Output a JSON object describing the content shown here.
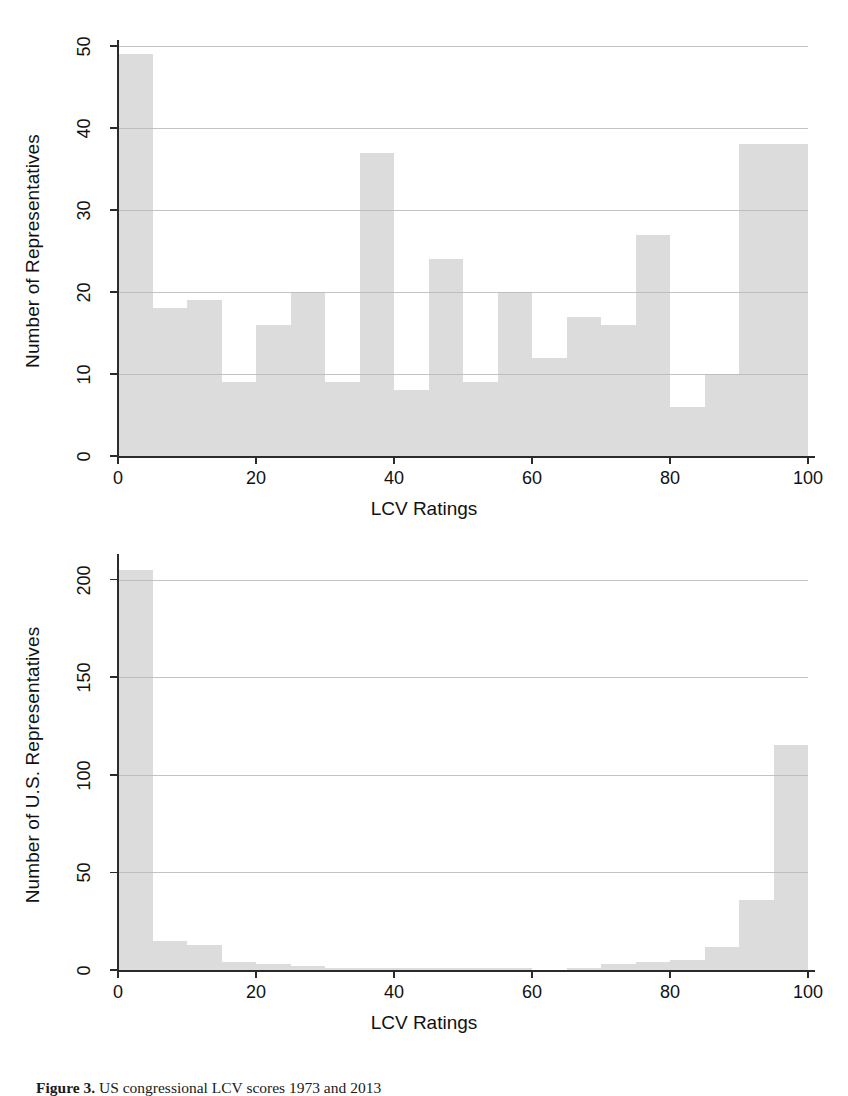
{
  "figure": {
    "caption_prefix": "Figure 3.",
    "caption_rest": " US congressional LCV scores 1973 and 2013"
  },
  "chart_data": [
    {
      "id": "top",
      "type": "bar",
      "title": "",
      "xlabel": "LCV Ratings",
      "ylabel": "Number of Representatives",
      "xlim": [
        0,
        100
      ],
      "ylim": [
        0,
        50
      ],
      "xticks": [
        0,
        20,
        40,
        60,
        80,
        100
      ],
      "yticks": [
        0,
        10,
        20,
        30,
        40,
        50
      ],
      "grid": "horizontal",
      "bin_width": 5,
      "bin_starts": [
        0,
        5,
        10,
        15,
        20,
        25,
        30,
        35,
        40,
        45,
        50,
        55,
        60,
        65,
        70,
        75,
        80,
        85,
        90,
        95
      ],
      "categories": [
        "0-5",
        "5-10",
        "10-15",
        "15-20",
        "20-25",
        "25-30",
        "30-35",
        "35-40",
        "40-45",
        "45-50",
        "50-55",
        "55-60",
        "60-65",
        "65-70",
        "70-75",
        "75-80",
        "80-85",
        "85-90",
        "90-95",
        "95-100"
      ],
      "values": [
        49,
        18,
        19,
        9,
        16,
        20,
        9,
        37,
        8,
        24,
        9,
        20,
        12,
        17,
        16,
        27,
        6,
        10,
        38,
        38
      ],
      "bar_color": "#dcdcdc"
    },
    {
      "id": "bottom",
      "type": "bar",
      "title": "",
      "xlabel": "LCV Ratings",
      "ylabel": "Number of U.S. Representatives",
      "xlim": [
        0,
        100
      ],
      "ylim": [
        0,
        210
      ],
      "xticks": [
        0,
        20,
        40,
        60,
        80,
        100
      ],
      "yticks": [
        0,
        50,
        100,
        150,
        200
      ],
      "grid": "horizontal",
      "bin_width": 5,
      "bin_starts": [
        0,
        5,
        10,
        15,
        20,
        25,
        30,
        35,
        40,
        45,
        50,
        55,
        60,
        65,
        70,
        75,
        80,
        85,
        90,
        95
      ],
      "categories": [
        "0-5",
        "5-10",
        "10-15",
        "15-20",
        "20-25",
        "25-30",
        "30-35",
        "35-40",
        "40-45",
        "45-50",
        "50-55",
        "55-60",
        "60-65",
        "65-70",
        "70-75",
        "75-80",
        "80-85",
        "85-90",
        "90-95",
        "95-100"
      ],
      "values": [
        205,
        15,
        13,
        4,
        3,
        2,
        1,
        1,
        1,
        1,
        1,
        1,
        0,
        1,
        3,
        4,
        5,
        12,
        36,
        115
      ],
      "bar_color": "#dcdcdc"
    }
  ]
}
